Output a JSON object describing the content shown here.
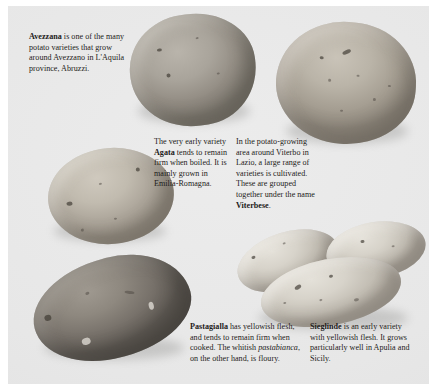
{
  "page": {
    "background_color": "#e8e8e8",
    "border_color": "#ffffff",
    "text_color": "#1d1b1a"
  },
  "captions": {
    "avezzana": {
      "term": "Avezzana",
      "text": " is one of the many potato varieties that grow around Avezzano in L'Aquila province, Abruzzi."
    },
    "agata": {
      "lead": "The very early variety ",
      "term": "Agata",
      "text": " tends to remain firm when boiled. It is mainly grown in Emilia-Romagna."
    },
    "viterbese": {
      "lead": "In the potato-growing area around Viterbo in Lazio, a large range of varieties is cultivated. These are grouped together under the name ",
      "term": "Viterbese",
      "text": "."
    },
    "pastagialla": {
      "term": "Pastagialla",
      "text_a": " has yellowish flesh, and tends to remain firm when cooked. The whitish ",
      "italic": "pastabianca",
      "text_b": ", on the other hand, is floury."
    },
    "sieglinde": {
      "term": "Sieglinde",
      "text": " is an early variety with yellowish flesh. It grows particularly well in Apulia and Sicily."
    }
  },
  "specimens": [
    {
      "name": "avezzana-potato",
      "label": "Avezzana",
      "color": "#a9a49b",
      "shape": "rounded-oblong"
    },
    {
      "name": "viterbese-potato",
      "label": "Viterbese",
      "color": "#bab4a8",
      "shape": "round"
    },
    {
      "name": "agata-potato",
      "label": "Agata",
      "color": "#c1bbaf",
      "shape": "oval"
    },
    {
      "name": "pastagialla-potato",
      "label": "Pastagialla",
      "color": "#8e887f",
      "shape": "elongated"
    },
    {
      "name": "sieglinde-potatoes",
      "label": "Sieglinde",
      "color": "#d7d3ca",
      "shape": "elongated-cluster",
      "count": 3
    }
  ]
}
